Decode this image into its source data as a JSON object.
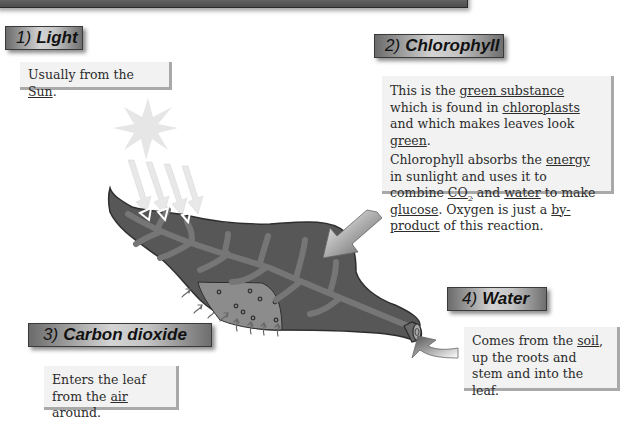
{
  "title_banner": {
    "text": ""
  },
  "sections": {
    "light": {
      "number": "1)",
      "title": "Light",
      "text": {
        "before": "Usually from the ",
        "link": "Sun",
        "after": "."
      }
    },
    "chlorophyll": {
      "number": "2)",
      "title": "Chlorophyll",
      "para1": {
        "t1": "This is the ",
        "u1": "green substance",
        "t2": " which is found in ",
        "u2": "chloroplasts",
        "t3": " and which makes leaves look ",
        "u3": "green",
        "t4": "."
      },
      "para2": {
        "t1": "Chlorophyll absorbs the ",
        "u1": "energy",
        "t2": " in sunlight and uses it to combine ",
        "u2": "CO",
        "u2_sub": "2",
        "t3": " and ",
        "u3": "water",
        "t4": " to make ",
        "u4": "glucose",
        "t5": ".  Oxygen is just a ",
        "u5": "by-product",
        "t6": " of this reaction."
      }
    },
    "carbon_dioxide": {
      "number": "3)",
      "title": "Carbon dioxide",
      "text": {
        "before": "Enters the leaf from the ",
        "link": "air",
        "after": " around."
      }
    },
    "water": {
      "number": "4)",
      "title": "Water",
      "text": {
        "before": "Comes from the ",
        "link": "soil",
        "after": ", up the roots and stem and into the leaf."
      }
    }
  },
  "colors": {
    "leaf": "#575757",
    "leaf_outline": "#2e2e2e",
    "veins": "#767676",
    "cut_region": "#8c8c8c",
    "sun": "#e6e6e6",
    "box_bg": "#f2f2f2"
  }
}
